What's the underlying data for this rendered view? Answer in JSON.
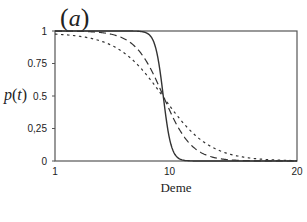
{
  "chart_data": {
    "type": "line",
    "title": "(a)",
    "xlabel": "Deme",
    "ylabel": "p(t)",
    "xlim": [
      1,
      20
    ],
    "ylim": [
      0,
      1
    ],
    "x_ticks": [
      "1",
      "10",
      "20"
    ],
    "y_ticks": [
      "0",
      "0,25",
      "0.5",
      "0.75",
      "1"
    ],
    "grid": false,
    "legend": null,
    "series": [
      {
        "name": "solid",
        "style": "solid",
        "center": 9.5,
        "steepness": 3.2,
        "x": [
          1,
          5,
          7,
          8,
          8.5,
          9,
          9.5,
          10,
          10.5,
          11,
          12,
          14,
          20
        ],
        "values": [
          1.0,
          1.0,
          1.0,
          0.99,
          0.97,
          0.83,
          0.5,
          0.17,
          0.03,
          0.01,
          0.0,
          0.0,
          0.0
        ]
      },
      {
        "name": "dashed",
        "style": "dashed",
        "center": 9.5,
        "steepness": 0.9,
        "x": [
          1,
          3,
          5,
          7,
          8,
          9,
          9.5,
          10,
          11,
          12,
          14,
          16,
          20
        ],
        "values": [
          1.0,
          1.0,
          0.98,
          0.9,
          0.79,
          0.61,
          0.5,
          0.39,
          0.21,
          0.1,
          0.02,
          0.0,
          0.0
        ]
      },
      {
        "name": "dash-dot",
        "style": "dotted",
        "center": 9.5,
        "steepness": 0.55,
        "x": [
          1,
          3,
          5,
          7,
          8,
          9,
          9.5,
          10,
          11,
          12,
          14,
          16,
          18,
          20
        ],
        "values": [
          0.97,
          0.94,
          0.91,
          0.8,
          0.7,
          0.57,
          0.5,
          0.43,
          0.3,
          0.2,
          0.08,
          0.03,
          0.01,
          0.0
        ]
      }
    ]
  },
  "labels": {
    "title": "(a)",
    "title_letter": "a",
    "ylabel_p": "p",
    "ylabel_t": "t",
    "xlabel": "Deme"
  }
}
